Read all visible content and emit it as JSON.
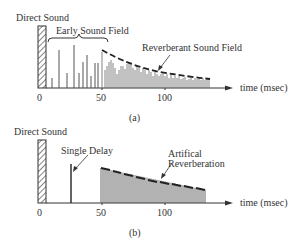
{
  "panel_a": {
    "direct_sound_label": "Direct Sound",
    "early_label": "Early Sound Field",
    "reverb_label": "Reverberant Sound Field",
    "x_ticks": [
      "0",
      "50",
      "100"
    ],
    "axis_label": "time (msec)",
    "caption": "(a)"
  },
  "panel_b": {
    "direct_sound_label": "Direct Sound",
    "delay_label": "Single Delay",
    "reverb_label_line1": "Artifical",
    "reverb_label_line2": "Reverberation",
    "x_ticks": [
      "0",
      "50",
      "100"
    ],
    "axis_label": "time (msec)",
    "caption": "(b)"
  },
  "colors": {
    "ink": "#333333",
    "background": "#ffffff"
  }
}
